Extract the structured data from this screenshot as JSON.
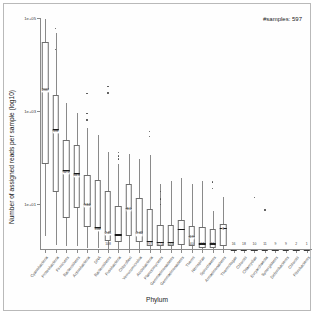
{
  "figure": {
    "samples_annotation": "#samples: 597",
    "xlabel": "Phylum",
    "ylabel": "Number of assigned reads per sample (log10)"
  },
  "chart_data": {
    "type": "box",
    "title": "",
    "xlabel": "Phylum",
    "ylabel": "Number of assigned reads per sample (log10)",
    "annotation": "#samples: 597",
    "ylim": [
      1,
      100000
    ],
    "yscale": "log10",
    "yticks": [
      100000,
      1000,
      10
    ],
    "ytick_labels": [
      "1e+05",
      "1e+03",
      "1e+01"
    ],
    "grid": false,
    "legend": "none",
    "categories": [
      "Cyanobacteria",
      "Proteobacteria",
      "Firmicutes",
      "Bacteroidetes",
      "Actinobacteria",
      "DNA",
      "Bacteroidetes",
      "Fusobacteria",
      "Chloroflexi",
      "Verrucomicrobia",
      "Acidobacteria",
      "Planctomycetes",
      "Gemmatimonadetes",
      "Gemmatimonadetes",
      "Thermi",
      "Nitrospirae",
      "Spirochaetes",
      "Armatimonadetes",
      "Thermotogae",
      "Chlorobi",
      "Chlamydiae",
      "Euryarchaeota",
      "Synergistetes",
      "Deferribacteres",
      "Chlorobi",
      "Fibrobacteres"
    ],
    "sample_counts": [
      "",
      "",
      "",
      "",
      "",
      "",
      "108",
      "",
      "",
      "",
      "97",
      "174",
      "188",
      "",
      "40",
      "17",
      "11",
      "",
      "16",
      "18",
      "10",
      "11",
      "9",
      "9",
      "2",
      "1"
    ],
    "median_labels": [
      "2987",
      "398",
      "52.1",
      "44.6",
      "9.84",
      "3.06",
      "2.45",
      "",
      "8.1",
      "2.42",
      "",
      "",
      "",
      "",
      "2.9",
      "",
      "",
      "3",
      "",
      "",
      "",
      "",
      "",
      "",
      "",
      ""
    ],
    "boxes": [
      {
        "category": "Cyanobacteria",
        "lower_whisker": 2.0,
        "q1": 70,
        "median": 2987,
        "q3": 30000,
        "upper_whisker": 95000,
        "outliers": []
      },
      {
        "category": "Proteobacteria",
        "lower_whisker": 1.3,
        "q1": 18,
        "median": 398,
        "q3": 2200,
        "upper_whisker": 48000,
        "outliers": [
          62000,
          22000
        ]
      },
      {
        "category": "Firmicutes",
        "lower_whisker": 1.2,
        "q1": 5.0,
        "median": 52.1,
        "q3": 230,
        "upper_whisker": 1500,
        "outliers": []
      },
      {
        "category": "Bacteroidetes",
        "lower_whisker": 1.2,
        "q1": 8.0,
        "median": 44.6,
        "q3": 180,
        "upper_whisker": 900,
        "outliers": []
      },
      {
        "category": "Actinobacteria",
        "lower_whisker": 1.1,
        "q1": 3.2,
        "median": 9.84,
        "q3": 42,
        "upper_whisker": 430,
        "outliers": [
          2400,
          900,
          650
        ]
      },
      {
        "category": "DNA",
        "lower_whisker": 1.1,
        "q1": 3.0,
        "median": 3.06,
        "q3": 33,
        "upper_whisker": 300,
        "outliers": []
      },
      {
        "category": "Bacteroidetes",
        "lower_whisker": 1.0,
        "q1": 1.6,
        "median": 2.45,
        "q3": 19,
        "upper_whisker": 130,
        "outliers": [
          2500,
          3400
        ]
      },
      {
        "category": "Fusobacteria",
        "lower_whisker": 1.0,
        "q1": 1.5,
        "median": 2.2,
        "q3": 9.0,
        "upper_whisker": 70,
        "outliers": [
          130,
          110,
          95
        ]
      },
      {
        "category": "Chloroflexi",
        "lower_whisker": 1.0,
        "q1": 2.0,
        "median": 8.1,
        "q3": 26,
        "upper_whisker": 120,
        "outliers": []
      },
      {
        "category": "Verrucomicrobia",
        "lower_whisker": 1.0,
        "q1": 1.5,
        "median": 2.42,
        "q3": 13,
        "upper_whisker": 90,
        "outliers": []
      },
      {
        "category": "Acidobacteria",
        "lower_whisker": 1.0,
        "q1": 1.2,
        "median": 1.6,
        "q3": 7.5,
        "upper_whisker": 110,
        "outliers": [
          370,
          290
        ]
      },
      {
        "category": "Planctomycetes",
        "lower_whisker": 1.0,
        "q1": 1.2,
        "median": 1.5,
        "q3": 3.5,
        "upper_whisker": 26,
        "outliers": [
          19,
          13,
          10
        ]
      },
      {
        "category": "Gemmatimonadetes",
        "lower_whisker": 1.0,
        "q1": 1.2,
        "median": 1.5,
        "q3": 3.5,
        "upper_whisker": 30,
        "outliers": []
      },
      {
        "category": "Gemmatimonadetes",
        "lower_whisker": 1.0,
        "q1": 1.3,
        "median": 2.9,
        "q3": 4.5,
        "upper_whisker": 36,
        "outliers": []
      },
      {
        "category": "Thermi",
        "lower_whisker": 1.0,
        "q1": 1.2,
        "median": 2.0,
        "q3": 3.3,
        "upper_whisker": 26,
        "outliers": []
      },
      {
        "category": "Nitrospirae",
        "lower_whisker": 1.0,
        "q1": 1.1,
        "median": 1.4,
        "q3": 3.1,
        "upper_whisker": 30,
        "outliers": []
      },
      {
        "category": "Spirochaetes",
        "lower_whisker": 1.0,
        "q1": 1.1,
        "median": 1.4,
        "q3": 2.8,
        "upper_whisker": 7.0,
        "outliers": [
          30,
          22
        ]
      },
      {
        "category": "Armatimonadetes",
        "lower_whisker": 1.0,
        "q1": 1.2,
        "median": 3.0,
        "q3": 3.6,
        "upper_whisker": 14,
        "outliers": []
      },
      {
        "category": "Thermotogae",
        "lower_whisker": 1.0,
        "q1": 1.0,
        "median": 1.0,
        "q3": 1.0,
        "upper_whisker": 1.0,
        "outliers": []
      },
      {
        "category": "Chlorobi",
        "lower_whisker": 1.0,
        "q1": 1.0,
        "median": 1.0,
        "q3": 1.0,
        "upper_whisker": 1.0,
        "outliers": []
      },
      {
        "category": "Chlamydiae",
        "lower_whisker": 1.0,
        "q1": 1.0,
        "median": 1.0,
        "q3": 1.0,
        "upper_whisker": 1.0,
        "outliers": [
          14
        ]
      },
      {
        "category": "Euryarchaeota",
        "lower_whisker": 1.0,
        "q1": 1.0,
        "median": 1.0,
        "q3": 1.0,
        "upper_whisker": 1.0,
        "outliers": [
          7.5
        ]
      },
      {
        "category": "Synergistetes",
        "lower_whisker": 1.0,
        "q1": 1.0,
        "median": 1.0,
        "q3": 1.0,
        "upper_whisker": 1.0,
        "outliers": []
      },
      {
        "category": "Deferribacteres",
        "lower_whisker": 1.0,
        "q1": 1.0,
        "median": 1.0,
        "q3": 1.0,
        "upper_whisker": 1.0,
        "outliers": []
      },
      {
        "category": "Chlorobi",
        "lower_whisker": 1.0,
        "q1": 1.0,
        "median": 1.0,
        "q3": 1.0,
        "upper_whisker": 1.0,
        "outliers": []
      },
      {
        "category": "Fibrobacteres",
        "lower_whisker": 1.0,
        "q1": 1.0,
        "median": 1.0,
        "q3": 1.0,
        "upper_whisker": 1.0,
        "outliers": []
      }
    ]
  },
  "style": {
    "frame_color": "#b9b9b9",
    "axis_color": "#8a8a8a",
    "box_color": "#6e6e6e",
    "median_color": "#1a1a1a",
    "outlier_color": "#4a4a4a",
    "background": "#ffffff"
  }
}
